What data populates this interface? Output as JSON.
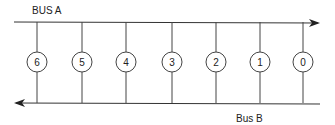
{
  "diagram": {
    "bus_a_label": "BUS A",
    "bus_b_label": "Bus B",
    "nodes": [
      {
        "label": "6",
        "x": 37
      },
      {
        "label": "5",
        "x": 82
      },
      {
        "label": "4",
        "x": 126
      },
      {
        "label": "3",
        "x": 172
      },
      {
        "label": "2",
        "x": 216
      },
      {
        "label": "1",
        "x": 260
      },
      {
        "label": "0",
        "x": 303
      }
    ],
    "bus_a_direction": "right",
    "bus_b_direction": "left"
  }
}
